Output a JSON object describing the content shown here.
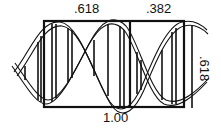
{
  "diagram": {
    "labels": {
      "top_left_width": ".618",
      "top_right_width": ".382",
      "bottom_total_width": "1.00",
      "right_height": ".618"
    },
    "colors": {
      "stroke": "#111111",
      "background": "#ffffff"
    }
  }
}
